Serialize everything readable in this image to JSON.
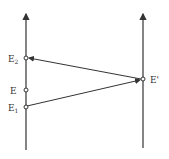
{
  "diagram": {
    "type": "spacetime-signal-diagram",
    "worldlines": [
      {
        "id": "left",
        "x": 26
      },
      {
        "id": "right",
        "x": 143
      }
    ],
    "events": [
      {
        "id": "E2",
        "label": "E",
        "subscript": "2",
        "x": 26,
        "y": 58
      },
      {
        "id": "E",
        "label": "E",
        "subscript": "",
        "x": 26,
        "y": 90
      },
      {
        "id": "E1",
        "label": "E",
        "subscript": "1",
        "x": 26,
        "y": 107
      },
      {
        "id": "Eprime",
        "label": "E'",
        "subscript": "",
        "x": 143,
        "y": 79
      }
    ],
    "signals": [
      {
        "from": "E1",
        "to": "Eprime"
      },
      {
        "from": "Eprime",
        "to": "E2"
      }
    ],
    "colors": {
      "line": "#333333",
      "background": "#ffffff"
    }
  }
}
